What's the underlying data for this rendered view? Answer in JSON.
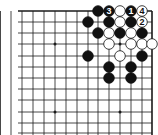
{
  "board": {
    "background": "#ffffff",
    "line_color": "#1a1a1a",
    "grid": {
      "x_lines": [
        0.5,
        11,
        22,
        33,
        44,
        55,
        66,
        77,
        88,
        98,
        109,
        120,
        131,
        142,
        152
      ],
      "y_lines": [
        11,
        22,
        33,
        44,
        56,
        67,
        78,
        89,
        100,
        112,
        123,
        133
      ],
      "top_edge": 11,
      "right_edge": 152,
      "bottom_cut": 135,
      "left_cut": 0
    },
    "star_points": [
      {
        "x": 55,
        "y": 44
      },
      {
        "x": 120,
        "y": 44
      },
      {
        "x": 55,
        "y": 112
      },
      {
        "x": 120,
        "y": 112
      }
    ],
    "stone_radius": 5.3,
    "stones": [
      {
        "color": "black",
        "x": 98,
        "y": 11
      },
      {
        "color": "black",
        "x": 109,
        "y": 11,
        "label": "3"
      },
      {
        "color": "white",
        "x": 120,
        "y": 11
      },
      {
        "color": "black",
        "x": 131,
        "y": 11,
        "label": "1"
      },
      {
        "color": "white",
        "x": 142,
        "y": 11,
        "label": "4"
      },
      {
        "color": "black",
        "x": 88,
        "y": 22
      },
      {
        "color": "black",
        "x": 109,
        "y": 22
      },
      {
        "color": "white",
        "x": 120,
        "y": 22
      },
      {
        "color": "black",
        "x": 131,
        "y": 22
      },
      {
        "color": "white",
        "x": 142,
        "y": 22,
        "label": "2"
      },
      {
        "color": "black",
        "x": 98,
        "y": 33
      },
      {
        "color": "white",
        "x": 109,
        "y": 33
      },
      {
        "color": "black",
        "x": 120,
        "y": 33
      },
      {
        "color": "white",
        "x": 131,
        "y": 33
      },
      {
        "color": "black",
        "x": 142,
        "y": 33
      },
      {
        "color": "white",
        "x": 109,
        "y": 44
      },
      {
        "color": "white",
        "x": 131,
        "y": 44
      },
      {
        "color": "white",
        "x": 142,
        "y": 44
      },
      {
        "color": "white",
        "x": 152,
        "y": 44
      },
      {
        "color": "black",
        "x": 88,
        "y": 56
      },
      {
        "color": "white",
        "x": 120,
        "y": 56
      },
      {
        "color": "black",
        "x": 142,
        "y": 56
      },
      {
        "color": "black",
        "x": 109,
        "y": 67
      },
      {
        "color": "black",
        "x": 131,
        "y": 67
      },
      {
        "color": "black",
        "x": 109,
        "y": 78
      },
      {
        "color": "black",
        "x": 131,
        "y": 78
      }
    ]
  }
}
